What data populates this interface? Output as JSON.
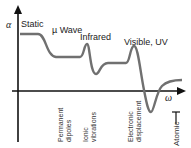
{
  "diagram": {
    "y_axis_symbol": "α",
    "x_axis_symbol": "ω",
    "regions": [
      "Static",
      "µ Wave",
      "Infrared",
      "Visible, UV"
    ],
    "mechanisms": [
      "Permanent\ndipoles",
      "Ionic\nvibrations",
      "Electronic\ndisplacement",
      "Atomic"
    ],
    "colors": {
      "curve": "#707070",
      "axis": "#111111"
    }
  }
}
